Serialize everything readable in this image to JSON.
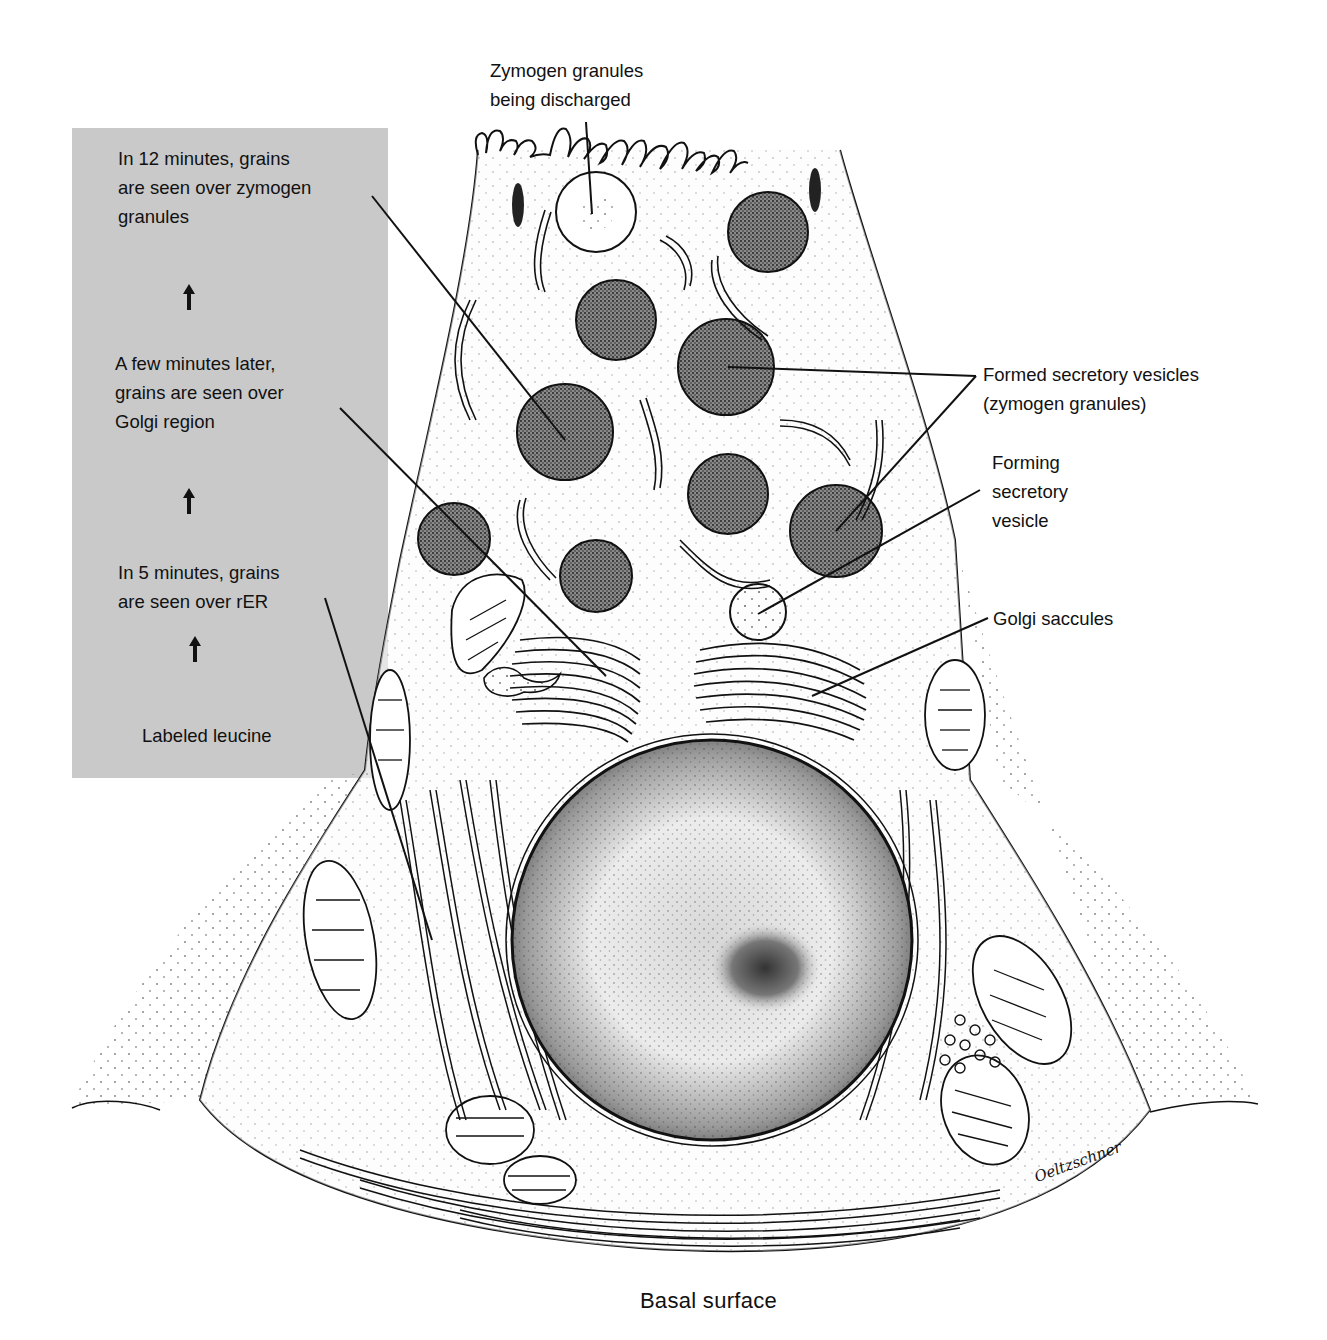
{
  "figure": {
    "type": "diagram",
    "panel_color": "#c9c9c9",
    "ink_color": "#111111"
  },
  "sequence_panel": {
    "steps": [
      {
        "lines": [
          "In 12 minutes, grains",
          "are seen over zymogen",
          "granules"
        ]
      },
      {
        "lines": [
          "A few minutes later,",
          "grains are seen over",
          "Golgi region"
        ]
      },
      {
        "lines": [
          "In 5 minutes, grains",
          "are seen over rER"
        ]
      },
      {
        "lines": [
          "Labeled leucine"
        ]
      }
    ],
    "arrows": [
      "up-arrow",
      "up-arrow",
      "up-arrow"
    ]
  },
  "labels": {
    "top": [
      "Zymogen granules",
      "being discharged"
    ],
    "formed_vesicles": [
      "Formed secretory vesicles",
      "(zymogen granules)"
    ],
    "forming_vesicle": [
      "Forming",
      "secretory",
      "vesicle"
    ],
    "golgi": [
      "Golgi saccules"
    ]
  },
  "footer": {
    "text": "Basal surface"
  },
  "signature": {
    "text": "Oeltzschner"
  }
}
